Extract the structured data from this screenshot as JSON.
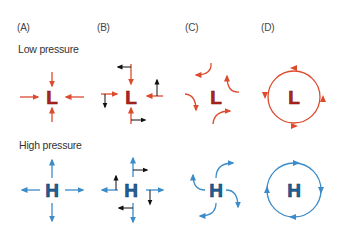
{
  "panels": [
    {
      "id": "A",
      "label": "(A)"
    },
    {
      "id": "B",
      "label": "(B)"
    },
    {
      "id": "C",
      "label": "(C)"
    },
    {
      "id": "D",
      "label": "(D)"
    }
  ],
  "rows": {
    "low": {
      "label": "Low pressure",
      "symbol": "L",
      "arrow_color": "#de4a2e",
      "symbol_fill": "#b3241c",
      "symbol_stroke": "#7a1510"
    },
    "high": {
      "label": "High pressure",
      "symbol": "H",
      "arrow_color": "#3b8cc9",
      "symbol_fill": "#1f5f99",
      "symbol_stroke": "#0f3d66"
    }
  },
  "deflection_arrow_color": "#111111",
  "descriptions": {
    "A": "Pressure gradient force only: air flows straight toward L and straight away from H",
    "B": "Coriolis deflection shown as small black arrows perpendicular to the flow",
    "C": "Flow curves as it is deflected by Coriolis force",
    "D": "Resulting circulation: counterclockwise around L, clockwise around H"
  }
}
